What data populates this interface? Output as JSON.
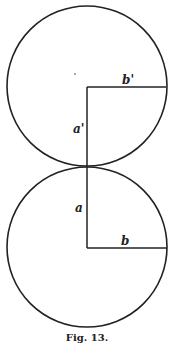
{
  "figure": {
    "caption": "Fig. 13.",
    "stroke_color": "#222222",
    "background": "#ffffff"
  },
  "top_circle": {
    "cx": 87,
    "cy": 86,
    "r": 80,
    "vertical_label": "a'",
    "horizontal_label": "b'"
  },
  "bottom_circle": {
    "cx": 87,
    "cy": 247,
    "r": 80,
    "vertical_label": "a",
    "horizontal_label": "b"
  },
  "tangent_point": {
    "x": 87,
    "y": 167
  }
}
